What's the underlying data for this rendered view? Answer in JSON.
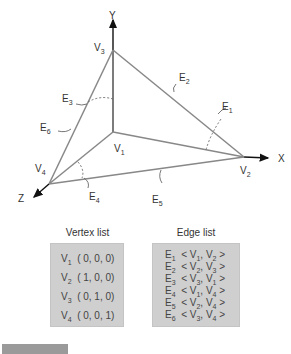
{
  "diagram": {
    "axes": {
      "x": "X",
      "y": "Y",
      "z": "Z"
    },
    "vertices": [
      {
        "name": "V",
        "sub": "1"
      },
      {
        "name": "V",
        "sub": "2"
      },
      {
        "name": "V",
        "sub": "3"
      },
      {
        "name": "V",
        "sub": "4"
      }
    ],
    "edges": [
      {
        "name": "E",
        "sub": "1"
      },
      {
        "name": "E",
        "sub": "2"
      },
      {
        "name": "E",
        "sub": "3"
      },
      {
        "name": "E",
        "sub": "4"
      },
      {
        "name": "E",
        "sub": "5"
      },
      {
        "name": "E",
        "sub": "6"
      }
    ]
  },
  "vertex_list": {
    "title": "Vertex list",
    "rows": [
      {
        "v": "V",
        "sub": "1",
        "coords": "( 0, 0, 0)"
      },
      {
        "v": "V",
        "sub": "2",
        "coords": "( 1, 0, 0)"
      },
      {
        "v": "V",
        "sub": "3",
        "coords": "( 0, 1, 0)"
      },
      {
        "v": "V",
        "sub": "4",
        "coords": "( 0, 0, 1)"
      }
    ]
  },
  "edge_list": {
    "title": "Edge list",
    "rows": [
      {
        "e": "E",
        "sub": "1",
        "a": "V",
        "a_sub": "1",
        "b": "V",
        "b_sub": "2"
      },
      {
        "e": "E",
        "sub": "2",
        "a": "V",
        "a_sub": "2",
        "b": "V",
        "b_sub": "3"
      },
      {
        "e": "E",
        "sub": "3",
        "a": "V",
        "a_sub": "3",
        "b": "V",
        "b_sub": "1"
      },
      {
        "e": "E",
        "sub": "4",
        "a": "V",
        "a_sub": "1",
        "b": "V",
        "b_sub": "4"
      },
      {
        "e": "E",
        "sub": "5",
        "a": "V",
        "a_sub": "2",
        "b": "V",
        "b_sub": "4"
      },
      {
        "e": "E",
        "sub": "6",
        "a": "V",
        "a_sub": "3",
        "b": "V",
        "b_sub": "4"
      }
    ]
  },
  "symbols": {
    "lt": "<",
    "gt": ">",
    "comma": ","
  }
}
